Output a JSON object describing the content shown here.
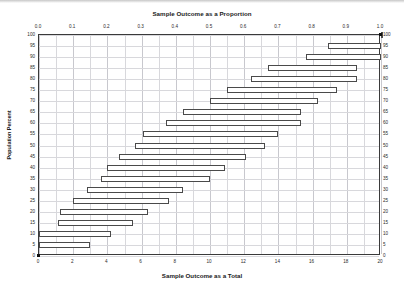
{
  "chart_data": {
    "type": "bar",
    "title": "Sample Outcome as a Proportion",
    "xlabel": "Sample Outcome as a Total",
    "ylabel": "Population Percent",
    "orientation": "horizontal",
    "bar_style": "interval",
    "grid": true,
    "legend": "none",
    "top_axis": {
      "label": "Sample Outcome as a Proportion",
      "ticks": [
        "0.0",
        "0.1",
        "0.2",
        "0.3",
        "0.4",
        "0.5",
        "0.6",
        "0.7",
        "0.8",
        "0.9",
        "1.0"
      ],
      "values": [
        0.0,
        0.1,
        0.2,
        0.3,
        0.4,
        0.5,
        0.6,
        0.7,
        0.8,
        0.9,
        1.0
      ],
      "range": [
        0.0,
        1.0
      ]
    },
    "bottom_axis": {
      "label": "Sample Outcome as a Total",
      "ticks": [
        "0",
        "2",
        "4",
        "6",
        "8",
        "10",
        "12",
        "14",
        "16",
        "18",
        "20"
      ],
      "values": [
        0,
        2,
        4,
        6,
        8,
        10,
        12,
        14,
        16,
        18,
        20
      ],
      "range": [
        0,
        20
      ]
    },
    "left_axis": {
      "label": "Population Percent",
      "ticks": [
        "100",
        "95",
        "90",
        "85",
        "80",
        "75",
        "70",
        "65",
        "60",
        "55",
        "50",
        "45",
        "40",
        "35",
        "30",
        "25",
        "20",
        "15",
        "10",
        "5",
        "0"
      ],
      "values": [
        100,
        95,
        90,
        85,
        80,
        75,
        70,
        65,
        60,
        55,
        50,
        45,
        40,
        35,
        30,
        25,
        20,
        15,
        10,
        5,
        0
      ],
      "range": [
        0,
        100
      ]
    },
    "right_axis": {
      "ticks": [
        "100",
        "95",
        "90",
        "85",
        "80",
        "75",
        "70",
        "65",
        "60",
        "55",
        "50",
        "45",
        "40",
        "35",
        "30",
        "25",
        "20",
        "15",
        "10",
        "5",
        "0"
      ],
      "values": [
        100,
        95,
        90,
        85,
        80,
        75,
        70,
        65,
        60,
        55,
        50,
        45,
        40,
        35,
        30,
        25,
        20,
        15,
        10,
        5,
        0
      ]
    },
    "categories": [
      100,
      95,
      90,
      85,
      80,
      75,
      70,
      65,
      60,
      55,
      50,
      45,
      40,
      35,
      30,
      25,
      20,
      15,
      10,
      5
    ],
    "series": [
      {
        "name": "Sample outcome interval (count out of 20)",
        "intervals": [
          {
            "population_percent": 100,
            "low": 20.0,
            "high": 20.0,
            "low_proportion": 1.0,
            "high_proportion": 1.0
          },
          {
            "population_percent": 95,
            "low": 16.9,
            "high": 20.0,
            "low_proportion": 0.845,
            "high_proportion": 1.0
          },
          {
            "population_percent": 90,
            "low": 15.6,
            "high": 20.0,
            "low_proportion": 0.78,
            "high_proportion": 1.0
          },
          {
            "population_percent": 85,
            "low": 13.4,
            "high": 18.6,
            "low_proportion": 0.67,
            "high_proportion": 0.93
          },
          {
            "population_percent": 80,
            "low": 12.4,
            "high": 18.6,
            "low_proportion": 0.62,
            "high_proportion": 0.93
          },
          {
            "population_percent": 75,
            "low": 11.0,
            "high": 17.4,
            "low_proportion": 0.55,
            "high_proportion": 0.87
          },
          {
            "population_percent": 70,
            "low": 10.0,
            "high": 16.3,
            "low_proportion": 0.5,
            "high_proportion": 0.815
          },
          {
            "population_percent": 65,
            "low": 8.4,
            "high": 15.3,
            "low_proportion": 0.42,
            "high_proportion": 0.765
          },
          {
            "population_percent": 60,
            "low": 7.4,
            "high": 15.3,
            "low_proportion": 0.37,
            "high_proportion": 0.765
          },
          {
            "population_percent": 55,
            "low": 6.1,
            "high": 14.0,
            "low_proportion": 0.305,
            "high_proportion": 0.7
          },
          {
            "population_percent": 50,
            "low": 5.6,
            "high": 13.2,
            "low_proportion": 0.28,
            "high_proportion": 0.66
          },
          {
            "population_percent": 45,
            "low": 4.7,
            "high": 12.1,
            "low_proportion": 0.235,
            "high_proportion": 0.605
          },
          {
            "population_percent": 40,
            "low": 4.0,
            "high": 10.9,
            "low_proportion": 0.2,
            "high_proportion": 0.545
          },
          {
            "population_percent": 35,
            "low": 3.6,
            "high": 10.0,
            "low_proportion": 0.18,
            "high_proportion": 0.5
          },
          {
            "population_percent": 30,
            "low": 2.8,
            "high": 8.4,
            "low_proportion": 0.14,
            "high_proportion": 0.42
          },
          {
            "population_percent": 25,
            "low": 2.0,
            "high": 7.6,
            "low_proportion": 0.1,
            "high_proportion": 0.38
          },
          {
            "population_percent": 20,
            "low": 1.2,
            "high": 6.4,
            "low_proportion": 0.06,
            "high_proportion": 0.32
          },
          {
            "population_percent": 15,
            "low": 1.1,
            "high": 5.5,
            "low_proportion": 0.055,
            "high_proportion": 0.275
          },
          {
            "population_percent": 10,
            "low": 0.0,
            "high": 4.2,
            "low_proportion": 0.0,
            "high_proportion": 0.21
          },
          {
            "population_percent": 5,
            "low": 0.0,
            "high": 3.0,
            "low_proportion": 0.0,
            "high_proportion": 0.15
          }
        ]
      }
    ],
    "colors": {
      "bar_fill": "#ffffff",
      "bar_stroke": "#4a4a4a",
      "grid": "#d8d8dc",
      "axis": "#3a3a3a",
      "text": "#1a1a1a"
    }
  }
}
